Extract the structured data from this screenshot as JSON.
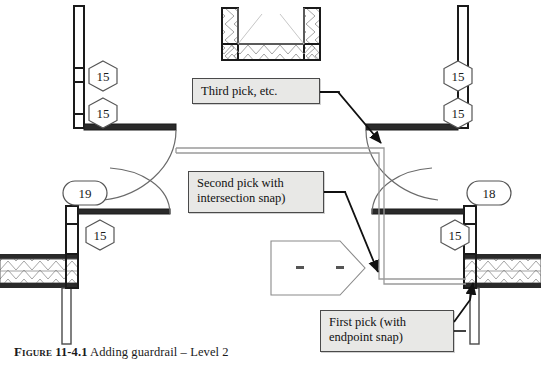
{
  "figure": {
    "caption_label": "Figure",
    "caption_number": "11-4.1",
    "caption_text": "Adding guardrail – Level 2",
    "background_color": "#ffffff"
  },
  "colors": {
    "wall_line": "#1a1a1a",
    "thin_line": "#8a8a8a",
    "callout_fill": "#e8e8e6",
    "callout_border": "#4a4a4a",
    "arrow": "#111111",
    "hatch": "#9a9a9a",
    "guardrail": "#9a9a9a"
  },
  "callouts": [
    {
      "name": "third-pick",
      "text": "Third pick, etc."
    },
    {
      "name": "second-pick",
      "text": "Second pick with\nintersection snap)"
    },
    {
      "name": "first-pick",
      "text": "First pick (with\nendpoint snap)"
    }
  ],
  "tags": [
    {
      "name": "tag-left-upper-15",
      "value": "15",
      "shape": "hexagon"
    },
    {
      "name": "tag-left-lower-15",
      "value": "15",
      "shape": "hexagon"
    },
    {
      "name": "tag-left-19",
      "value": "19",
      "shape": "oval"
    },
    {
      "name": "tag-left-mid-15",
      "value": "15",
      "shape": "hexagon"
    },
    {
      "name": "tag-right-upper-15",
      "value": "15",
      "shape": "hexagon"
    },
    {
      "name": "tag-right-lower-15",
      "value": "15",
      "shape": "hexagon"
    },
    {
      "name": "tag-right-18",
      "value": "18",
      "shape": "oval"
    },
    {
      "name": "tag-right-mid-15",
      "value": "15",
      "shape": "hexagon"
    }
  ]
}
